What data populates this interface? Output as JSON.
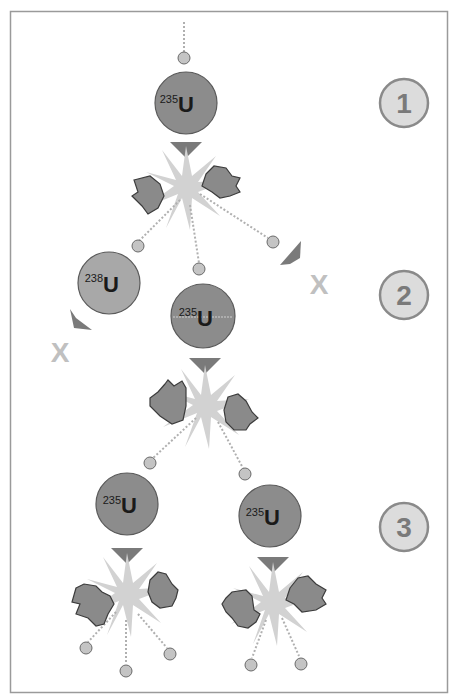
{
  "diagram": {
    "colors": {
      "frame": "#9a9a9a",
      "nucleus_235_fill": "#8c8c8c",
      "nucleus_238_fill": "#a8a8a8",
      "nucleus_stroke": "#5a5a5a",
      "neutron_fill": "#c4c4c4",
      "neutron_stroke": "#6a6a6a",
      "fragment_fill": "#8a8a8a",
      "fragment_stroke": "#3c3c3c",
      "burst": "#d0d0d0",
      "arrow": "#7a7a7a",
      "x_mark": "#c0c0c0",
      "badge_fill": "#dcdcdc",
      "badge_stroke": "#8a8a8a",
      "badge_text": "#7a7a7a",
      "label_text": "#1a1a1a"
    },
    "steps": [
      {
        "label": "1"
      },
      {
        "label": "2"
      },
      {
        "label": "3"
      }
    ],
    "nuclei": [
      {
        "id": "u235-stage1",
        "mass": "235",
        "symbol": "U"
      },
      {
        "id": "u238-stage2",
        "mass": "238",
        "symbol": "U"
      },
      {
        "id": "u235-stage2",
        "mass": "235",
        "symbol": "U"
      },
      {
        "id": "u235-stage3-left",
        "mass": "235",
        "symbol": "U"
      },
      {
        "id": "u235-stage3-right",
        "mass": "235",
        "symbol": "U"
      }
    ],
    "absorbed_marks": [
      {
        "label": "X"
      },
      {
        "label": "X"
      }
    ]
  }
}
